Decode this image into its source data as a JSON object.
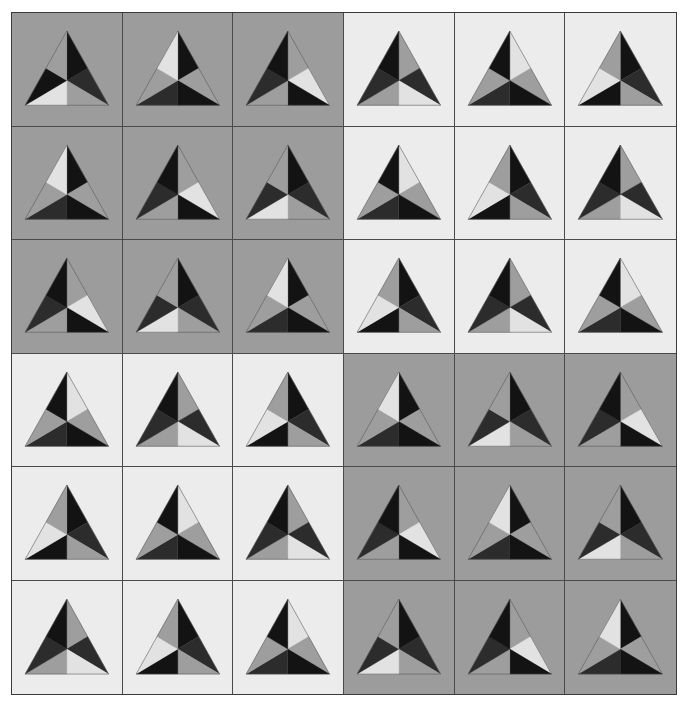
{
  "palette": {
    "bg_gray": "#9c9c9c",
    "bg_light": "#ececec",
    "L": "#e2e2e2",
    "M": "#9e9e9e",
    "D": "#2c2c2c",
    "K": "#131313",
    "edge": "#555555"
  },
  "grid": {
    "rows": 6,
    "cols": 6,
    "sector_order": [
      "apex-right",
      "right-lower",
      "bottom-right",
      "bottom-left",
      "left-lower",
      "apex-left"
    ],
    "tiles": [
      [
        {
          "bg": "gray",
          "sectors": [
            "K",
            "D",
            "M",
            "L",
            "K",
            "M"
          ]
        },
        {
          "bg": "gray",
          "sectors": [
            "K",
            "M",
            "K",
            "D",
            "M",
            "L"
          ]
        },
        {
          "bg": "gray",
          "sectors": [
            "M",
            "L",
            "K",
            "M",
            "D",
            "K"
          ]
        },
        {
          "bg": "light",
          "sectors": [
            "M",
            "D",
            "L",
            "M",
            "D",
            "K"
          ]
        },
        {
          "bg": "light",
          "sectors": [
            "L",
            "M",
            "K",
            "D",
            "M",
            "K"
          ]
        },
        {
          "bg": "light",
          "sectors": [
            "K",
            "D",
            "M",
            "K",
            "L",
            "M"
          ]
        }
      ],
      [
        {
          "bg": "gray",
          "sectors": [
            "K",
            "M",
            "K",
            "D",
            "M",
            "L"
          ]
        },
        {
          "bg": "gray",
          "sectors": [
            "M",
            "L",
            "K",
            "M",
            "D",
            "K"
          ]
        },
        {
          "bg": "gray",
          "sectors": [
            "K",
            "D",
            "M",
            "L",
            "D",
            "M"
          ]
        },
        {
          "bg": "light",
          "sectors": [
            "L",
            "M",
            "K",
            "D",
            "M",
            "K"
          ]
        },
        {
          "bg": "light",
          "sectors": [
            "K",
            "D",
            "M",
            "K",
            "L",
            "M"
          ]
        },
        {
          "bg": "light",
          "sectors": [
            "M",
            "D",
            "L",
            "M",
            "D",
            "K"
          ]
        }
      ],
      [
        {
          "bg": "gray",
          "sectors": [
            "M",
            "L",
            "K",
            "M",
            "D",
            "K"
          ]
        },
        {
          "bg": "gray",
          "sectors": [
            "K",
            "D",
            "M",
            "L",
            "D",
            "M"
          ]
        },
        {
          "bg": "gray",
          "sectors": [
            "K",
            "M",
            "K",
            "D",
            "M",
            "L"
          ]
        },
        {
          "bg": "light",
          "sectors": [
            "K",
            "D",
            "M",
            "K",
            "L",
            "M"
          ]
        },
        {
          "bg": "light",
          "sectors": [
            "M",
            "D",
            "L",
            "M",
            "D",
            "K"
          ]
        },
        {
          "bg": "light",
          "sectors": [
            "L",
            "M",
            "K",
            "D",
            "M",
            "K"
          ]
        }
      ],
      [
        {
          "bg": "light",
          "sectors": [
            "L",
            "M",
            "K",
            "D",
            "M",
            "K"
          ]
        },
        {
          "bg": "light",
          "sectors": [
            "M",
            "D",
            "L",
            "M",
            "D",
            "K"
          ]
        },
        {
          "bg": "light",
          "sectors": [
            "K",
            "D",
            "M",
            "K",
            "L",
            "M"
          ]
        },
        {
          "bg": "gray",
          "sectors": [
            "K",
            "M",
            "K",
            "D",
            "M",
            "L"
          ]
        },
        {
          "bg": "gray",
          "sectors": [
            "K",
            "D",
            "M",
            "L",
            "D",
            "M"
          ]
        },
        {
          "bg": "gray",
          "sectors": [
            "M",
            "L",
            "K",
            "M",
            "D",
            "K"
          ]
        }
      ],
      [
        {
          "bg": "light",
          "sectors": [
            "K",
            "D",
            "M",
            "K",
            "L",
            "M"
          ]
        },
        {
          "bg": "light",
          "sectors": [
            "L",
            "M",
            "K",
            "D",
            "M",
            "K"
          ]
        },
        {
          "bg": "light",
          "sectors": [
            "M",
            "D",
            "L",
            "M",
            "D",
            "K"
          ]
        },
        {
          "bg": "gray",
          "sectors": [
            "M",
            "L",
            "K",
            "M",
            "D",
            "K"
          ]
        },
        {
          "bg": "gray",
          "sectors": [
            "K",
            "M",
            "K",
            "D",
            "M",
            "L"
          ]
        },
        {
          "bg": "gray",
          "sectors": [
            "K",
            "D",
            "M",
            "L",
            "D",
            "M"
          ]
        }
      ],
      [
        {
          "bg": "light",
          "sectors": [
            "M",
            "D",
            "L",
            "M",
            "D",
            "K"
          ]
        },
        {
          "bg": "light",
          "sectors": [
            "K",
            "D",
            "M",
            "K",
            "L",
            "M"
          ]
        },
        {
          "bg": "light",
          "sectors": [
            "L",
            "M",
            "K",
            "D",
            "M",
            "K"
          ]
        },
        {
          "bg": "gray",
          "sectors": [
            "K",
            "D",
            "M",
            "L",
            "D",
            "M"
          ]
        },
        {
          "bg": "gray",
          "sectors": [
            "M",
            "L",
            "K",
            "M",
            "D",
            "K"
          ]
        },
        {
          "bg": "gray",
          "sectors": [
            "K",
            "M",
            "K",
            "D",
            "M",
            "L"
          ]
        }
      ]
    ]
  }
}
